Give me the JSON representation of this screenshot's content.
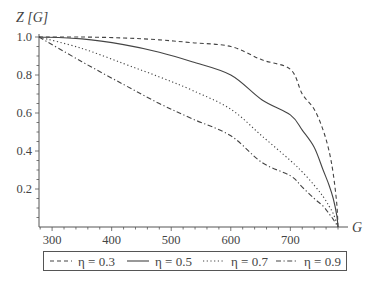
{
  "chart_data": {
    "type": "line",
    "title": "",
    "xlabel": "G",
    "ylabel": "Z [G]",
    "xlim": [
      278,
      780
    ],
    "ylim": [
      0,
      1.0
    ],
    "grid": false,
    "legend_position": "bottom",
    "xticks": [
      300,
      400,
      500,
      600,
      700
    ],
    "yticks": [
      0.2,
      0.4,
      0.6,
      0.8,
      1.0
    ],
    "xtick_labels": [
      "300",
      "400",
      "500",
      "600",
      "700"
    ],
    "ytick_labels": [
      "0.2",
      "0.4",
      "0.6",
      "0.8",
      "1.0"
    ],
    "x": [
      278,
      350,
      420,
      480,
      535,
      600,
      652,
      700,
      720,
      740,
      755,
      765,
      772,
      778,
      780
    ],
    "series": [
      {
        "name": "η = 0.3",
        "style": "dashed",
        "values": [
          1.0,
          1.0,
          0.995,
          0.985,
          0.97,
          0.95,
          0.88,
          0.83,
          0.7,
          0.62,
          0.51,
          0.4,
          0.28,
          0.12,
          0.0
        ]
      },
      {
        "name": "η = 0.5",
        "style": "solid",
        "values": [
          1.0,
          0.99,
          0.96,
          0.92,
          0.87,
          0.8,
          0.67,
          0.59,
          0.51,
          0.42,
          0.3,
          0.22,
          0.15,
          0.06,
          0.0
        ]
      },
      {
        "name": "η = 0.7",
        "style": "dotted",
        "values": [
          1.0,
          0.94,
          0.86,
          0.79,
          0.72,
          0.62,
          0.48,
          0.35,
          0.29,
          0.22,
          0.16,
          0.11,
          0.07,
          0.02,
          0.0
        ]
      },
      {
        "name": "η = 0.9",
        "style": "dash-dot",
        "values": [
          1.0,
          0.87,
          0.75,
          0.65,
          0.57,
          0.48,
          0.34,
          0.27,
          0.21,
          0.15,
          0.11,
          0.07,
          0.04,
          0.01,
          0.0
        ]
      }
    ]
  },
  "legend": {
    "items": [
      {
        "label": "η = 0.3",
        "dash": "4,3"
      },
      {
        "label": "η = 0.5",
        "dash": ""
      },
      {
        "label": "η = 0.7",
        "dash": "1.2,2.5"
      },
      {
        "label": "η = 0.9",
        "dash": "5,2.5,1.2,2.5"
      }
    ]
  },
  "colors": {
    "axis": "#555555",
    "line": "#444444"
  }
}
